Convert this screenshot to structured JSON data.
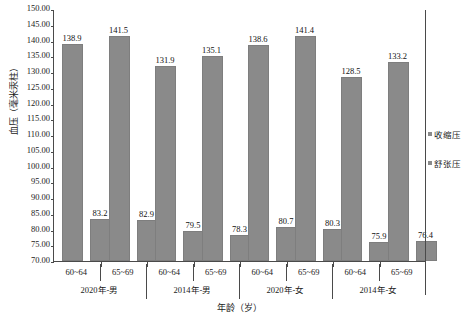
{
  "chart_data": {
    "type": "bar",
    "title": "",
    "xlabel": "年龄（岁）",
    "ylabel": "血压（毫米汞柱）",
    "ylim": [
      70.0,
      150.0
    ],
    "ytick_step": 5.0,
    "ytick_labels": [
      "150.00",
      "145.00",
      "140.00",
      "135.00",
      "130.00",
      "125.00",
      "120.00",
      "115.00",
      "110.00",
      "105.00",
      "100.00",
      "95.00",
      "90.00",
      "85.00",
      "80.00",
      "75.00",
      "70.00"
    ],
    "grid": false,
    "legend_position": "right",
    "bar_color": "#8a8a8a",
    "categories": [
      "60~64",
      "65~69",
      "60~64",
      "65~69",
      "60~64",
      "65~69",
      "60~64",
      "65~69"
    ],
    "groups": [
      {
        "label": "2020年-男",
        "categories": [
          "60~64",
          "65~69"
        ]
      },
      {
        "label": "2014年-男",
        "categories": [
          "60~64",
          "65~69"
        ]
      },
      {
        "label": "2020年-女",
        "categories": [
          "60~64",
          "65~69"
        ]
      },
      {
        "label": "2014年-女",
        "categories": [
          "60~64",
          "65~69"
        ]
      }
    ],
    "series": [
      {
        "name": "收缩压",
        "values": [
          138.9,
          141.5,
          131.9,
          135.1,
          138.6,
          141.4,
          128.5,
          133.2
        ]
      },
      {
        "name": "舒张压",
        "values": [
          83.2,
          82.9,
          79.5,
          78.3,
          80.7,
          80.3,
          75.9,
          76.4
        ]
      }
    ],
    "data_labels": [
      {
        "group": "2020年-男",
        "age": "60~64",
        "收缩压": "138.9",
        "舒张压": "83.2"
      },
      {
        "group": "2020年-男",
        "age": "65~69",
        "收缩压": "141.5",
        "舒张压": "82.9"
      },
      {
        "group": "2014年-男",
        "age": "60~64",
        "收缩压": "131.9",
        "舒张压": "79.5"
      },
      {
        "group": "2014年-男",
        "age": "65~69",
        "收缩压": "135.1",
        "舒张压": "78.3"
      },
      {
        "group": "2020年-女",
        "age": "60~64",
        "收缩压": "138.6",
        "舒张压": "80.7"
      },
      {
        "group": "2020年-女",
        "age": "65~69",
        "收缩压": "141.4",
        "舒张压": "80.3"
      },
      {
        "group": "2014年-女",
        "age": "60~64",
        "收缩压": "128.5",
        "舒张压": "75.9"
      },
      {
        "group": "2014年-女",
        "age": "65~69",
        "收缩压": "133.2",
        "舒张压": "76.4"
      }
    ]
  },
  "legend": {
    "entries": [
      {
        "label": "收缩压",
        "color": "#8a8a8a"
      },
      {
        "label": "舒张压",
        "color": "#8a8a8a"
      }
    ]
  }
}
